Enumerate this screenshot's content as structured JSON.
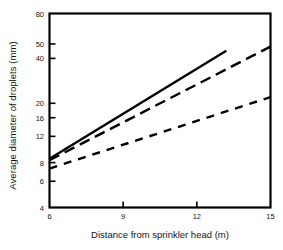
{
  "chart_data": {
    "type": "line",
    "title": "",
    "xlabel": "Distance from sprinkler head (m)",
    "ylabel": "Average diameter of droplets (mm)",
    "xscale": "linear",
    "yscale": "log",
    "xlim": [
      6,
      15
    ],
    "ylim": [
      4,
      80
    ],
    "grid": false,
    "legend": "none",
    "xticks": [
      {
        "value": 6,
        "label": "6"
      },
      {
        "value": 9,
        "label": "9"
      },
      {
        "value": 12,
        "label": "12"
      },
      {
        "value": 15,
        "label": "15"
      }
    ],
    "yticks": [
      {
        "value": 80,
        "label": "80"
      },
      {
        "value": 50,
        "label": "50"
      },
      {
        "value": 40,
        "label": "40"
      },
      {
        "value": 20,
        "label": "20"
      },
      {
        "value": 16,
        "label": "16"
      },
      {
        "value": 12,
        "label": "12"
      },
      {
        "value": 8,
        "label": "8"
      },
      {
        "value": 6,
        "label": "6"
      },
      {
        "value": 4,
        "label": "4"
      }
    ],
    "series": [
      {
        "name": "upper-solid",
        "style": "solid",
        "color": "#000000",
        "x": [
          6,
          13.2
        ],
        "y": [
          8.5,
          45.0
        ]
      },
      {
        "name": "middle-long-dashed",
        "style": "long-dashed",
        "color": "#000000",
        "x": [
          6,
          15
        ],
        "y": [
          8.3,
          48.0
        ]
      },
      {
        "name": "lower-dashed",
        "style": "dashed",
        "color": "#000000",
        "x": [
          6,
          15
        ],
        "y": [
          7.3,
          22.0
        ]
      }
    ]
  },
  "axes": {
    "frame_color": "#000000",
    "background": "#ffffff"
  }
}
